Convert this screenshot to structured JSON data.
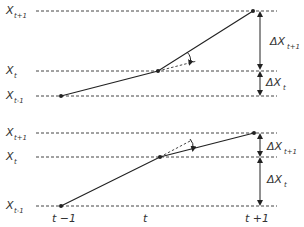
{
  "top_panel": {
    "levels": [
      {
        "label": "X",
        "sub": "t+1",
        "y": 11
      },
      {
        "label": "X",
        "sub": "t",
        "y": 71
      },
      {
        "label": "X",
        "sub": "t-1",
        "y": 96
      }
    ],
    "points": [
      [
        61,
        96
      ],
      [
        158,
        71
      ],
      [
        253,
        11
      ]
    ],
    "deltas": [
      {
        "label": "ΔX",
        "sub": "t+1"
      },
      {
        "label": "ΔX",
        "sub": "t"
      }
    ]
  },
  "bottom_panel": {
    "levels": [
      {
        "label": "X",
        "sub": "t+1",
        "y": 133
      },
      {
        "label": "X",
        "sub": "t",
        "y": 157
      },
      {
        "label": "X",
        "sub": "t-1",
        "y": 206
      }
    ],
    "points": [
      [
        61,
        206
      ],
      [
        160,
        157
      ],
      [
        254,
        133
      ]
    ],
    "deltas": [
      {
        "label": "ΔX",
        "sub": "t+1"
      },
      {
        "label": "ΔX",
        "sub": "t"
      }
    ]
  },
  "time_axis": {
    "ticks": [
      "t −1",
      "t",
      "t +1"
    ]
  }
}
